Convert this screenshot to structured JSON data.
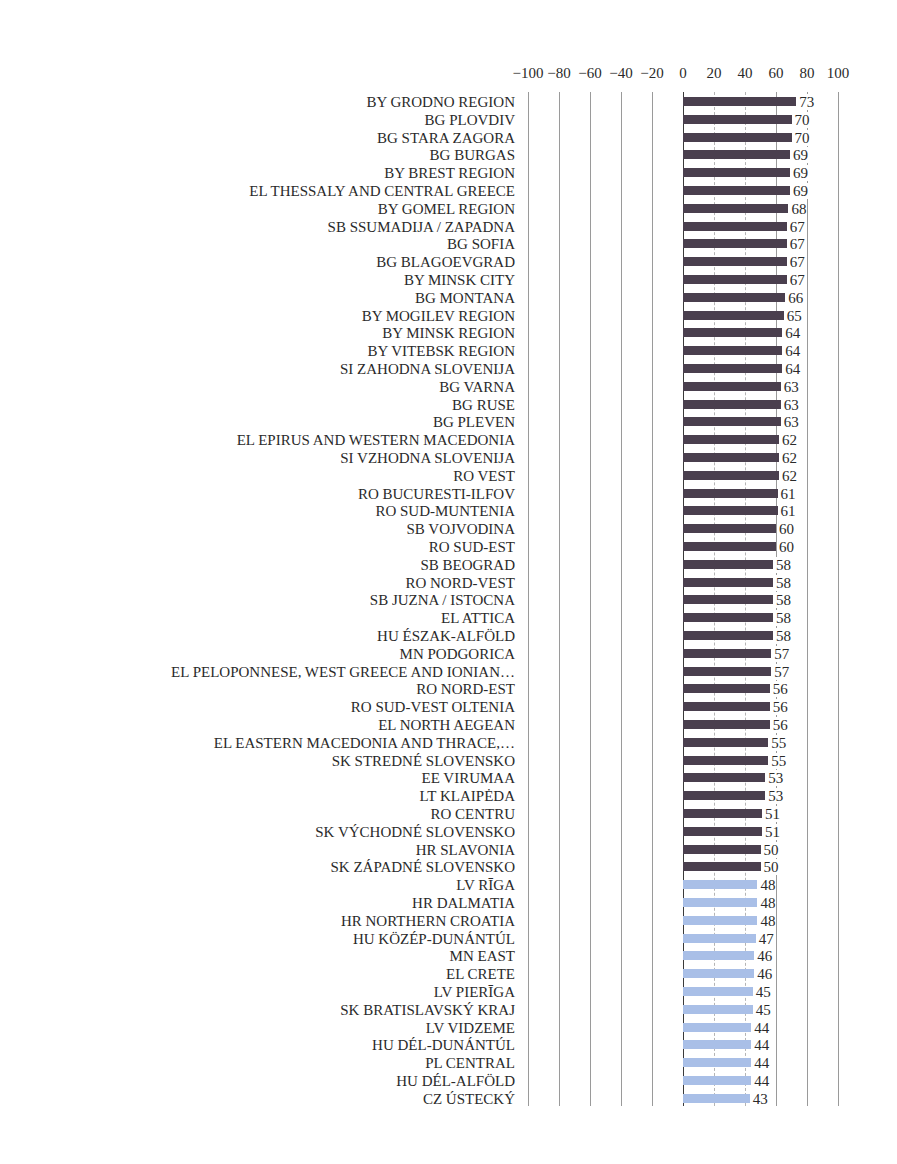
{
  "chart_data": {
    "type": "bar",
    "orientation": "horizontal",
    "title": "",
    "xlabel": "",
    "ylabel": "",
    "xlim": [
      -100,
      100
    ],
    "x_ticks": [
      "-100",
      "-80",
      "-60",
      "-40",
      "-20",
      "0",
      "20",
      "40",
      "60",
      "80",
      "100"
    ],
    "grid": true,
    "legend": null,
    "threshold_color_rule": "values >= 50 dark, values < 50 light blue",
    "colors": {
      "high": "#4a3f4e",
      "low": "#a9bfe7"
    },
    "categories": [
      "BY GRODNO REGION",
      "BG PLOVDIV",
      "BG STARA ZAGORA",
      "BG BURGAS",
      "BY BREST REGION",
      "EL THESSALY AND CENTRAL GREECE",
      "BY GOMEL REGION",
      "SB SSUMADIJA / ZAPADNA",
      "BG SOFIA",
      "BG BLAGOEVGRAD",
      "BY MINSK CITY",
      "BG MONTANA",
      "BY MOGILEV REGION",
      "BY MINSK REGION",
      "BY VITEBSK REGION",
      "SI ZAHODNA SLOVENIJA",
      "BG VARNA",
      "BG RUSE",
      "BG PLEVEN",
      "EL EPIRUS AND WESTERN MACEDONIA",
      "SI VZHODNA SLOVENIJA",
      "RO VEST",
      "RO BUCURESTI-ILFOV",
      "RO SUD-MUNTENIA",
      "SB VOJVODINA",
      "RO SUD-EST",
      "SB BEOGRAD",
      "RO NORD-VEST",
      "SB JUZNA / ISTOCNA",
      "EL ATTICA",
      "HU ÉSZAK-ALFÖLD",
      "MN PODGORICA",
      "EL PELOPONNESE, WEST GREECE AND IONIAN…",
      "RO NORD-EST",
      "RO SUD-VEST OLTENIA",
      "EL NORTH AEGEAN",
      "EL EASTERN MACEDONIA AND THRACE,…",
      "SK STREDNÉ SLOVENSKO",
      "EE VIRUMAA",
      "LT KLAIPĖDA",
      "RO CENTRU",
      "SK VÝCHODNÉ SLOVENSKO",
      "HR SLAVONIA",
      "SK ZÁPADNÉ SLOVENSKO",
      "LV RĪGA",
      "HR DALMATIA",
      "HR NORTHERN CROATIA",
      "HU KÖZÉP-DUNÁNTÚL",
      "MN EAST",
      "EL CRETE",
      "LV PIERĪGA",
      "SK BRATISLAVSKÝ KRAJ",
      "LV VIDZEME",
      "HU DÉL-DUNÁNTÚL",
      "PL CENTRAL",
      "HU DÉL-ALFÖLD",
      "CZ ÚSTECKÝ"
    ],
    "values": [
      73,
      70,
      70,
      69,
      69,
      69,
      68,
      67,
      67,
      67,
      67,
      66,
      65,
      64,
      64,
      64,
      63,
      63,
      63,
      62,
      62,
      62,
      61,
      61,
      60,
      60,
      58,
      58,
      58,
      58,
      58,
      57,
      57,
      56,
      56,
      56,
      55,
      55,
      53,
      53,
      51,
      51,
      50,
      50,
      48,
      48,
      48,
      47,
      46,
      46,
      45,
      45,
      44,
      44,
      44,
      44,
      43
    ]
  }
}
